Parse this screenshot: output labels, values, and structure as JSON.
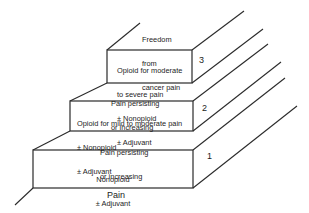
{
  "diagram": {
    "type": "analgesic-ladder",
    "steps": [
      {
        "number": "1",
        "treatment_lines": [
          "Nonopioid",
          "± Adjuvant"
        ]
      },
      {
        "number": "2",
        "treatment_lines": [
          "Opioid for mild to moderate pain",
          "± Nonopioid",
          "± Adjuvant"
        ]
      },
      {
        "number": "3",
        "treatment_lines": [
          "Opioid for moderate",
          "to severe pain",
          "± Nonopioid",
          "± Adjuvant"
        ]
      }
    ],
    "transitions": [
      {
        "lines": [
          "Pain persisting",
          "or increasing"
        ]
      },
      {
        "lines": [
          "Pain persisting",
          "or increasing"
        ]
      }
    ],
    "base_label": "Pain",
    "top_label_lines": [
      "Freedom",
      "from",
      "cancer pain"
    ],
    "colors": {
      "line": "#2a2a2a",
      "text": "#1c1c1c",
      "background": "#ffffff"
    }
  }
}
